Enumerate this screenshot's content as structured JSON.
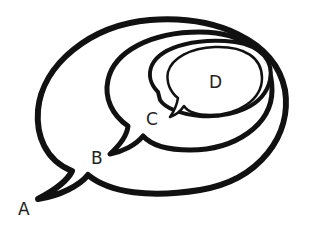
{
  "diagram": {
    "type": "nested-speech-bubbles",
    "bubbles": [
      {
        "id": "A",
        "label": "A",
        "level": 1,
        "stroke": "#111111"
      },
      {
        "id": "B",
        "label": "B",
        "level": 2,
        "stroke": "#111111"
      },
      {
        "id": "C",
        "label": "C",
        "level": 3,
        "stroke": "#111111"
      },
      {
        "id": "D",
        "label": "D",
        "level": 4,
        "stroke": "#111111"
      }
    ]
  }
}
